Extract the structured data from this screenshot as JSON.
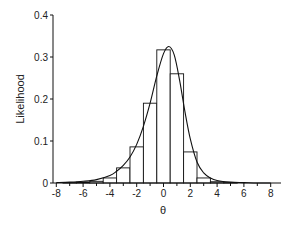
{
  "chart_data": {
    "type": "bar",
    "title": "",
    "xlabel": "θ",
    "ylabel": "Likelihood",
    "xlim": [
      -8.5,
      8.5
    ],
    "ylim": [
      0,
      0.4
    ],
    "x_ticks": [
      -8,
      -6,
      -4,
      -2,
      0,
      2,
      4,
      6,
      8
    ],
    "x_tick_labels": [
      "-8",
      "-6",
      "-4",
      "-2",
      "0",
      "2",
      "4",
      "6",
      "8"
    ],
    "y_ticks": [
      0,
      0.1,
      0.2,
      0.3,
      0.4
    ],
    "y_tick_labels": [
      "0",
      "0.1",
      "0.2",
      "0.3",
      "0.4"
    ],
    "grid": false,
    "legend": null,
    "histogram": {
      "bin_width": 1,
      "bin_centers": [
        -7,
        -6,
        -5,
        -4,
        -3,
        -2,
        -1,
        0,
        1,
        2,
        3,
        4,
        5,
        6
      ],
      "values": [
        0.001,
        0.002,
        0.004,
        0.012,
        0.036,
        0.086,
        0.19,
        0.317,
        0.26,
        0.074,
        0.012,
        0.003,
        0.001,
        0.0
      ]
    },
    "curve": {
      "name": "fitted density",
      "peak_x": 0.4,
      "peak_y": 0.325,
      "x": [
        -8,
        -7,
        -6,
        -5,
        -4,
        -3.5,
        -3,
        -2.5,
        -2,
        -1.5,
        -1,
        -0.5,
        0,
        0.4,
        0.8,
        1.2,
        1.6,
        2,
        2.5,
        3,
        3.5,
        4,
        5,
        6,
        7,
        8
      ],
      "y": [
        0.001,
        0.002,
        0.004,
        0.008,
        0.018,
        0.028,
        0.042,
        0.062,
        0.092,
        0.135,
        0.19,
        0.255,
        0.308,
        0.325,
        0.305,
        0.245,
        0.17,
        0.105,
        0.05,
        0.024,
        0.012,
        0.006,
        0.002,
        0.001,
        0.0,
        0.0
      ]
    }
  }
}
